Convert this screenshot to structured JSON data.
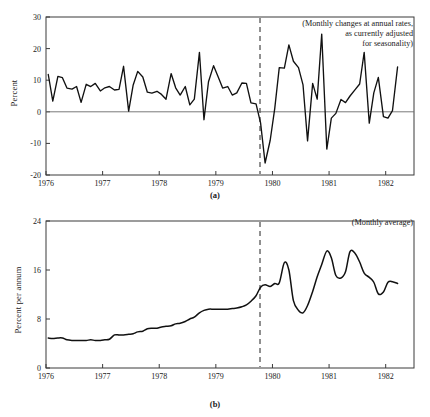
{
  "figure": {
    "panel_a_caption": "(a)",
    "panel_b_caption": "(b)"
  },
  "chart_data": [
    {
      "id": "panel-a",
      "type": "line",
      "title": "",
      "annotation": "(Monthly changes at annual rates,\nas currently adjusted\nfor seasonality)",
      "xlabel": "",
      "ylabel": "Percent",
      "xlim": [
        1976.0,
        1982.5
      ],
      "ylim": [
        -20,
        30
      ],
      "yticks": [
        -20,
        -10,
        0,
        10,
        20,
        30
      ],
      "ytick_labels": [
        "-20",
        "-10",
        "0",
        "10",
        "20",
        "30"
      ],
      "xticks": [
        1976,
        1977,
        1978,
        1979,
        1980,
        1981,
        1982
      ],
      "xtick_labels": [
        "1976",
        "1977",
        "1978",
        "1979",
        "1980",
        "1981",
        "1982"
      ],
      "grid": false,
      "legend": "none",
      "zero_line": 0,
      "event_marker_x": 1979.78,
      "x": [
        1976.04,
        1976.12,
        1976.21,
        1976.29,
        1976.37,
        1976.46,
        1976.54,
        1976.62,
        1976.71,
        1976.79,
        1976.87,
        1976.96,
        1977.04,
        1977.12,
        1977.21,
        1977.29,
        1977.37,
        1977.46,
        1977.54,
        1977.62,
        1977.71,
        1977.79,
        1977.87,
        1977.96,
        1978.04,
        1978.12,
        1978.21,
        1978.29,
        1978.37,
        1978.46,
        1978.54,
        1978.62,
        1978.71,
        1978.79,
        1978.87,
        1978.96,
        1979.04,
        1979.12,
        1979.21,
        1979.29,
        1979.37,
        1979.46,
        1979.54,
        1979.62,
        1979.71,
        1979.79,
        1979.87,
        1979.96,
        1980.04,
        1980.12,
        1980.21,
        1980.29,
        1980.37,
        1980.46,
        1980.54,
        1980.62,
        1980.71,
        1980.79,
        1980.87,
        1980.96,
        1981.04,
        1981.12,
        1981.21,
        1981.29,
        1981.37,
        1981.46,
        1981.54,
        1981.62,
        1981.71,
        1981.79,
        1981.87,
        1981.96,
        1982.04,
        1982.12,
        1982.21
      ],
      "y": [
        11.8,
        3.4,
        11.2,
        10.8,
        7.5,
        7.2,
        8.0,
        3.0,
        8.7,
        8.0,
        9.0,
        6.6,
        7.6,
        8.0,
        6.9,
        7.1,
        14.4,
        0.2,
        8.5,
        12.8,
        11.0,
        6.2,
        5.9,
        6.5,
        5.5,
        4.0,
        12.1,
        7.6,
        5.3,
        8.0,
        2.2,
        4.0,
        18.8,
        -2.5,
        9.5,
        14.6,
        11.1,
        7.5,
        8.0,
        5.3,
        6.0,
        9.1,
        9.0,
        2.8,
        2.5,
        -3.5,
        -16.2,
        -9.0,
        1.0,
        14.0,
        13.8,
        21.2,
        16.0,
        14.0,
        8.5,
        -9.2,
        9.0,
        4.0,
        24.6,
        -11.8,
        -2.0,
        -0.5,
        3.9,
        2.9,
        5.0,
        7.0,
        8.8,
        18.8,
        -3.6,
        6.0,
        10.9,
        -1.5,
        -2.0,
        0.4,
        14.2
      ]
    },
    {
      "id": "panel-b",
      "type": "line",
      "title": "",
      "annotation": "(Monthly average)",
      "xlabel": "",
      "ylabel": "Percent per annum",
      "xlim": [
        1976.0,
        1982.5
      ],
      "ylim": [
        0,
        24
      ],
      "yticks": [
        0,
        8,
        16,
        24
      ],
      "ytick_labels": [
        "0",
        "8",
        "16",
        "24"
      ],
      "xticks": [
        1976,
        1977,
        1978,
        1979,
        1980,
        1981,
        1982
      ],
      "xtick_labels": [
        "1976",
        "1977",
        "1978",
        "1979",
        "1980",
        "1981",
        "1982"
      ],
      "grid": false,
      "legend": "none",
      "event_marker_x": 1979.78,
      "x": [
        1976.04,
        1976.12,
        1976.21,
        1976.29,
        1976.37,
        1976.46,
        1976.54,
        1976.62,
        1976.71,
        1976.79,
        1976.87,
        1976.96,
        1977.04,
        1977.12,
        1977.21,
        1977.29,
        1977.37,
        1977.46,
        1977.54,
        1977.62,
        1977.71,
        1977.79,
        1977.87,
        1977.96,
        1978.04,
        1978.12,
        1978.21,
        1978.29,
        1978.37,
        1978.46,
        1978.54,
        1978.62,
        1978.71,
        1978.79,
        1978.87,
        1978.96,
        1979.04,
        1979.12,
        1979.21,
        1979.29,
        1979.37,
        1979.46,
        1979.54,
        1979.62,
        1979.71,
        1979.79,
        1979.87,
        1979.96,
        1980.04,
        1980.12,
        1980.21,
        1980.29,
        1980.37,
        1980.46,
        1980.54,
        1980.62,
        1980.71,
        1980.79,
        1980.87,
        1980.96,
        1981.04,
        1981.12,
        1981.21,
        1981.29,
        1981.37,
        1981.46,
        1981.54,
        1981.62,
        1981.71,
        1981.79,
        1981.87,
        1981.96,
        1982.04,
        1982.12,
        1982.21
      ],
      "y": [
        4.9,
        4.8,
        4.9,
        4.9,
        4.6,
        4.5,
        4.5,
        4.5,
        4.5,
        4.6,
        4.5,
        4.5,
        4.6,
        4.7,
        5.4,
        5.4,
        5.4,
        5.5,
        5.6,
        5.9,
        6.0,
        6.4,
        6.5,
        6.5,
        6.7,
        6.8,
        6.9,
        7.2,
        7.3,
        7.6,
        8.0,
        8.3,
        9.0,
        9.4,
        9.6,
        9.6,
        9.6,
        9.6,
        9.6,
        9.7,
        9.8,
        10.0,
        10.3,
        10.9,
        11.8,
        13.2,
        13.6,
        13.3,
        13.8,
        13.9,
        17.2,
        16.0,
        11.0,
        9.4,
        9.0,
        10.2,
        12.5,
        14.9,
        16.9,
        19.1,
        18.0,
        15.1,
        14.7,
        15.7,
        19.0,
        18.7,
        17.3,
        15.5,
        14.8,
        14.0,
        12.1,
        12.4,
        14.0,
        14.1,
        13.8
      ]
    }
  ]
}
